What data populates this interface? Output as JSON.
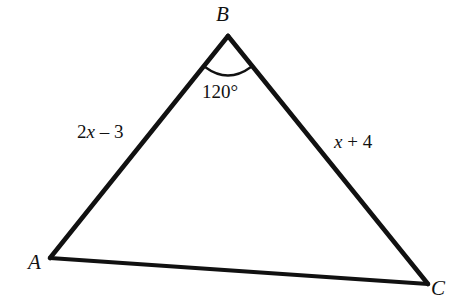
{
  "figure": {
    "type": "triangle-diagram",
    "background_color": "#ffffff",
    "stroke_color": "#111111",
    "stroke_width": 4.5,
    "vertices": [
      {
        "name": "A",
        "label": "A",
        "x": 50,
        "y": 258
      },
      {
        "name": "B",
        "label": "B",
        "x": 228,
        "y": 36
      },
      {
        "name": "C",
        "label": "C",
        "x": 428,
        "y": 284
      }
    ],
    "sides": [
      {
        "name": "AB",
        "label": "2x – 3",
        "label_parts": {
          "coefficient": "2",
          "variable": "x",
          "operator": "–",
          "constant": "3"
        },
        "from": "A",
        "to": "B"
      },
      {
        "name": "BC",
        "label": "x + 4",
        "label_parts": {
          "coefficient": "",
          "variable": "x",
          "operator": "+",
          "constant": "4"
        },
        "from": "B",
        "to": "C"
      },
      {
        "name": "AC",
        "label": "",
        "from": "A",
        "to": "C"
      }
    ],
    "angles": [
      {
        "at_vertex": "B",
        "label": "120°",
        "value": 120,
        "unit": "degrees",
        "arc": {
          "center_x": 228,
          "center_y": 36,
          "radius": 38,
          "start_x": 205,
          "start_y": 67,
          "end_x": 251,
          "end_y": 67
        }
      }
    ]
  }
}
